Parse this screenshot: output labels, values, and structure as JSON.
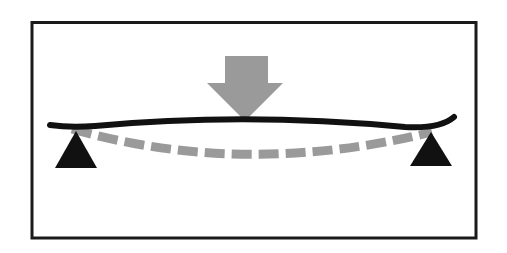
{
  "diagram": {
    "title": "",
    "colors": {
      "background": "#ffffff",
      "frame": "#1a1a1a",
      "beam": "#111111",
      "load_arrow": "#9a9a9a",
      "deflected_shape": "#9a9a9a",
      "supports": "#111111"
    },
    "elements": {
      "frame": {
        "label": "frame-border"
      },
      "load_arrow": {
        "label": "downward-point-load",
        "direction": "down"
      },
      "beam": {
        "label": "beam"
      },
      "deflected_shape": {
        "label": "deflected-beam-dashed",
        "style": "dashed"
      },
      "supports": [
        {
          "label": "left-support",
          "type": "triangle"
        },
        {
          "label": "right-support",
          "type": "triangle"
        }
      ]
    }
  }
}
